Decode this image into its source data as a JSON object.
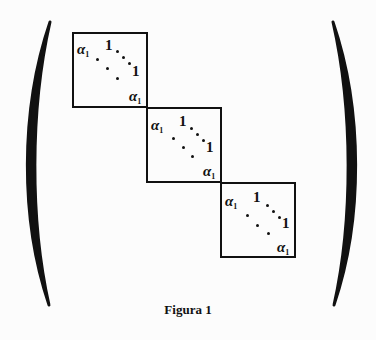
{
  "figure": {
    "caption": "Figura 1",
    "blocks": [
      {
        "diag": "α",
        "diag_sub": "1",
        "super": "1",
        "x": 72,
        "y": 32,
        "size": 76
      },
      {
        "diag": "α",
        "diag_sub": "1",
        "super": "1",
        "x": 146,
        "y": 107,
        "size": 76
      },
      {
        "diag": "α",
        "diag_sub": "1",
        "super": "1",
        "x": 220,
        "y": 182,
        "size": 76
      }
    ],
    "colors": {
      "ink": "#111111",
      "background": "#fcfcfc"
    }
  }
}
